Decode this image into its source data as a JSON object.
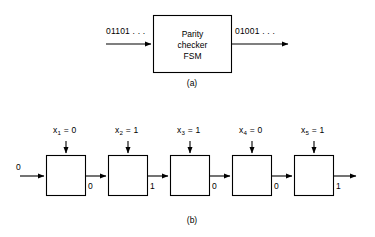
{
  "figure": {
    "part_a": {
      "caption": "(a)",
      "input_label": "01101 . . .",
      "output_label": "01001 . . .",
      "block": {
        "line1": "Parity",
        "line2": "checker",
        "line3": "FSM"
      }
    },
    "part_b": {
      "caption": "(b)",
      "initial_state": "0",
      "stages": [
        {
          "input_var": "x",
          "input_sub": "1",
          "input_eq": "= 0",
          "output_bit": "0"
        },
        {
          "input_var": "x",
          "input_sub": "2",
          "input_eq": "= 1",
          "output_bit": "1"
        },
        {
          "input_var": "x",
          "input_sub": "3",
          "input_eq": "= 1",
          "output_bit": "0"
        },
        {
          "input_var": "x",
          "input_sub": "4",
          "input_eq": "= 0",
          "output_bit": "0"
        },
        {
          "input_var": "x",
          "input_sub": "5",
          "input_eq": "= 1",
          "output_bit": "1"
        }
      ]
    }
  },
  "style": {
    "stroke": "#000000",
    "background": "#ffffff"
  }
}
